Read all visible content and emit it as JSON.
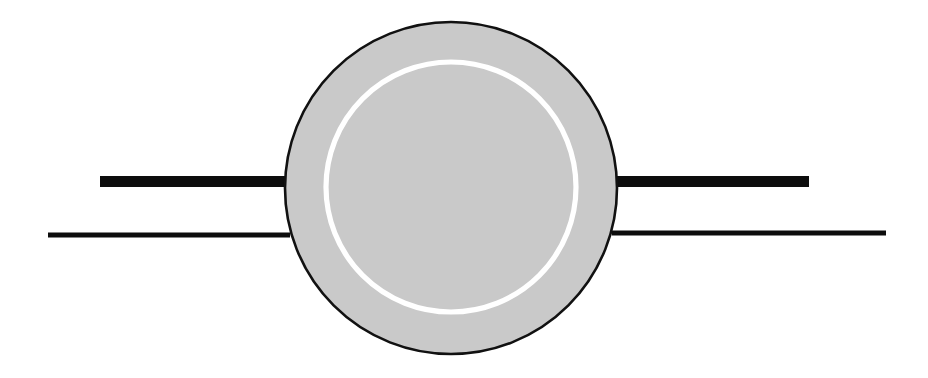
{
  "figure": {
    "title": "Schematic line drawing: shaded disc with inner white ring and four horizontal leads",
    "canvas": {
      "width": 928,
      "height": 378,
      "background": "#ffffff"
    },
    "palette": {
      "background": "#ffffff",
      "disc_fill": "#c9c9c9",
      "disc_stroke": "#111111",
      "inner_ring_stroke": "#ffffff",
      "lead_color": "#0d0d0d"
    },
    "shapes": [
      {
        "name": "outer-disc",
        "kind": "circle",
        "cx": 451,
        "cy": 188,
        "r": 166,
        "fill": "#c9c9c9",
        "stroke": "#111111",
        "stroke_width": 2.6
      },
      {
        "name": "inner-ring",
        "kind": "circle",
        "cx": 451,
        "cy": 187,
        "r": 125,
        "fill": "none",
        "stroke": "#ffffff",
        "stroke_width": 5.2
      }
    ],
    "leads": [
      {
        "name": "lead-upper-left",
        "x1": 100,
        "y1": 181.5,
        "x2": 290,
        "y2": 181.5,
        "thickness": 11,
        "color": "#0d0d0d",
        "side": "left",
        "weight": "thick"
      },
      {
        "name": "lead-upper-right",
        "x1": 612,
        "y1": 181.5,
        "x2": 809,
        "y2": 181.5,
        "thickness": 11,
        "color": "#0d0d0d",
        "side": "right",
        "weight": "thick"
      },
      {
        "name": "lead-lower-left",
        "x1": 48,
        "y1": 235,
        "x2": 290,
        "y2": 235,
        "thickness": 5,
        "color": "#0d0d0d",
        "side": "left",
        "weight": "thin"
      },
      {
        "name": "lead-lower-right",
        "x1": 612,
        "y1": 233,
        "x2": 886,
        "y2": 233,
        "thickness": 5,
        "color": "#0d0d0d",
        "side": "right",
        "weight": "thin"
      }
    ]
  }
}
